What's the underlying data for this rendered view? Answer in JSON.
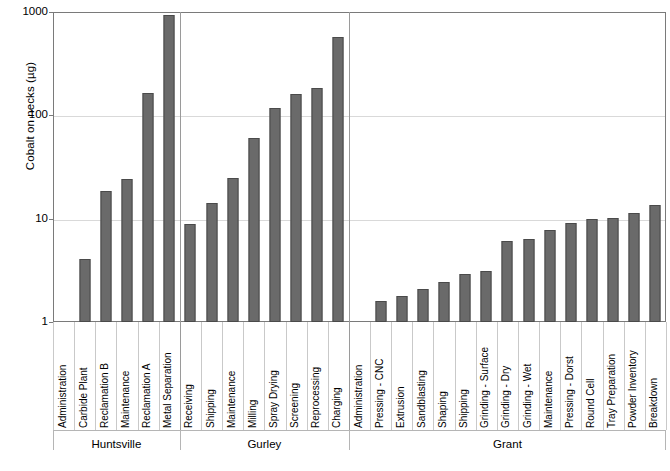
{
  "chart_data": {
    "type": "bar",
    "title": "",
    "xlabel": "",
    "ylabel": "Cobalt on necks (µg)",
    "yscale": "log",
    "ylim": [
      1,
      1000
    ],
    "y_ticks": [
      "1",
      "10",
      "100",
      "1000"
    ],
    "grid": "horizontal",
    "legend": "none",
    "bar_color": "#6a6a6a",
    "categories": [
      "Administration",
      "Carbide Plant",
      "Reclamation B",
      "Maintenance",
      "Reclamation A",
      "Metal Separation",
      "Receiving",
      "Shipping",
      "Maintenance",
      "Milling",
      "Spray Drying",
      "Screening",
      "Reprocessing",
      "Charging",
      "Administration",
      "Pressing - CNC",
      "Extrusion",
      "Sandblasting",
      "Shaping",
      "Shipping",
      "Grinding - Surface",
      "Grinding - Dry",
      "Grinding - Wet",
      "Maintenance",
      "Pressing - Dorst",
      "Round Cell",
      "Tray Preparation",
      "Powder Inventory",
      "Breakdown"
    ],
    "values": [
      null,
      4.1,
      18.5,
      24.2,
      165,
      930,
      8.9,
      14.2,
      24.8,
      60,
      118,
      161,
      184,
      570,
      null,
      1.6,
      1.8,
      2.1,
      2.45,
      2.9,
      3.15,
      6.1,
      6.4,
      7.8,
      9.1,
      9.9,
      10.1,
      11.4,
      13.6
    ],
    "groups": [
      {
        "label": "Huntsville",
        "start": 0,
        "end": 5
      },
      {
        "label": "Gurley",
        "start": 6,
        "end": 13
      },
      {
        "label": "Grant",
        "start": 14,
        "end": 28
      }
    ]
  }
}
